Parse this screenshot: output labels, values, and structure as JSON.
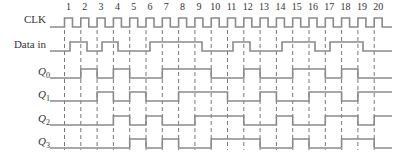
{
  "diagram": {
    "type": "timing-diagram",
    "clock_pulse_numbers": [
      "1",
      "2",
      "3",
      "4",
      "5",
      "6",
      "7",
      "8",
      "9",
      "10",
      "11",
      "12",
      "13",
      "14",
      "15",
      "16",
      "17",
      "18",
      "19",
      "20"
    ],
    "signals": [
      {
        "name": "CLK",
        "label": "CLK",
        "subscript": ""
      },
      {
        "name": "data-in",
        "label": "Data in",
        "subscript": ""
      },
      {
        "name": "q0",
        "label": "Q",
        "subscript": "0"
      },
      {
        "name": "q1",
        "label": "Q",
        "subscript": "1"
      },
      {
        "name": "q2",
        "label": "Q",
        "subscript": "2"
      },
      {
        "name": "q3",
        "label": "Q",
        "subscript": "3"
      }
    ],
    "waveforms": {
      "data_in_high_intervals": [
        [
          70,
          87
        ],
        [
          102,
          118
        ],
        [
          150,
          202
        ],
        [
          233,
          250
        ],
        [
          282,
          315
        ],
        [
          330,
          363
        ]
      ],
      "q0_high_edges": [
        [
          2,
          3
        ],
        [
          4,
          5
        ],
        [
          7,
          10
        ],
        [
          12,
          13
        ],
        [
          15,
          17
        ],
        [
          18,
          19
        ]
      ],
      "q1_high_edges": [
        [
          3,
          4
        ],
        [
          5,
          6
        ],
        [
          8,
          11
        ],
        [
          13,
          14
        ],
        [
          16,
          18
        ],
        [
          19,
          21
        ]
      ],
      "q2_high_edges": [
        [
          4,
          5
        ],
        [
          6,
          7
        ],
        [
          9,
          12
        ],
        [
          14,
          15
        ],
        [
          17,
          19
        ],
        [
          20,
          21
        ]
      ],
      "q3_high_edges": [
        [
          5,
          6
        ],
        [
          7,
          8
        ],
        [
          10,
          13
        ],
        [
          15,
          16
        ],
        [
          18,
          20
        ]
      ]
    },
    "colors": {
      "waveform": "#8a8a8a",
      "dashed_line": "#555555",
      "text": "#333333"
    }
  }
}
